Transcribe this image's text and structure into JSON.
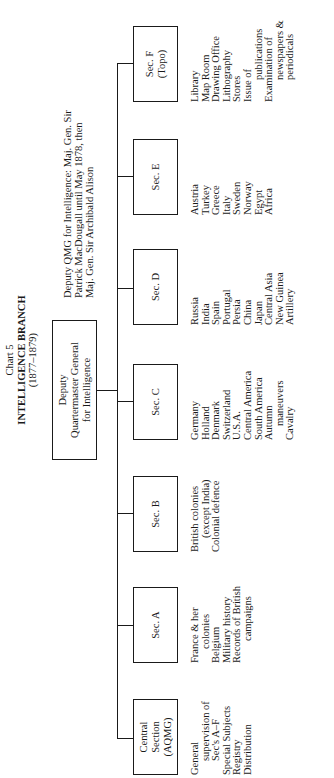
{
  "header": {
    "chart_label": "Chart 5",
    "title": "INTELLIGENCE BRANCH",
    "years": "(1877–1879)"
  },
  "head_box": {
    "lines": [
      "Deputy",
      "Quartermaster General",
      "for Intelligence"
    ]
  },
  "note": {
    "lines": [
      "Deputy QMG for Intelligence:  Maj. Gen. Sir",
      "Patrick MacDougall until May 1878, then",
      "Maj. Gen. Sir Archibald Alison"
    ]
  },
  "sections": [
    {
      "id": "central",
      "label_lines": [
        "Central",
        "Section",
        "(AQMG)"
      ],
      "duties": [
        {
          "text": "General",
          "indent": 0
        },
        {
          "text": "supervision of",
          "indent": 1
        },
        {
          "text": "Sec's A–F",
          "indent": 1
        },
        {
          "text": "Special Subjects",
          "indent": 0
        },
        {
          "text": "Registry",
          "indent": 0
        },
        {
          "text": "Distribution",
          "indent": 0
        }
      ]
    },
    {
      "id": "a",
      "label_lines": [
        "Sec. A"
      ],
      "duties": [
        {
          "text": "France & her",
          "indent": 0
        },
        {
          "text": "colonies",
          "indent": 1
        },
        {
          "text": "Belgium",
          "indent": 0
        },
        {
          "text": "Military history",
          "indent": 0
        },
        {
          "text": "Records of British",
          "indent": 0
        },
        {
          "text": "campaigns",
          "indent": 2
        }
      ]
    },
    {
      "id": "b",
      "label_lines": [
        "Sec. B"
      ],
      "duties": [
        {
          "text": "British colonies",
          "indent": 0
        },
        {
          "text": "(except India)",
          "indent": 1
        },
        {
          "text": "Colonial defence",
          "indent": 0
        }
      ]
    },
    {
      "id": "c",
      "label_lines": [
        "Sec. C"
      ],
      "duties": [
        {
          "text": "Germany",
          "indent": 0
        },
        {
          "text": "Holland",
          "indent": 0
        },
        {
          "text": "Denmark",
          "indent": 0
        },
        {
          "text": "Switzerland",
          "indent": 0
        },
        {
          "text": "U.S.A.",
          "indent": 0
        },
        {
          "text": "Central America",
          "indent": 0
        },
        {
          "text": "South America",
          "indent": 0
        },
        {
          "text": "Autumn",
          "indent": 0
        },
        {
          "text": "maneuvers",
          "indent": 1
        },
        {
          "text": "Cavalry",
          "indent": 0
        }
      ]
    },
    {
      "id": "d",
      "label_lines": [
        "Sec. D"
      ],
      "duties": [
        {
          "text": "Russia",
          "indent": 0
        },
        {
          "text": "India",
          "indent": 0
        },
        {
          "text": "Spain",
          "indent": 0
        },
        {
          "text": "Portugal",
          "indent": 0
        },
        {
          "text": "Persia",
          "indent": 0
        },
        {
          "text": "China",
          "indent": 0
        },
        {
          "text": "Japan",
          "indent": 0
        },
        {
          "text": "Central Asia",
          "indent": 0
        },
        {
          "text": "New Guinea",
          "indent": 0
        },
        {
          "text": "Artillery",
          "indent": 0
        }
      ]
    },
    {
      "id": "e",
      "label_lines": [
        "Sec. E"
      ],
      "duties": [
        {
          "text": "Austria",
          "indent": 0
        },
        {
          "text": "Turkey",
          "indent": 0
        },
        {
          "text": "Greece",
          "indent": 0
        },
        {
          "text": "Italy",
          "indent": 0
        },
        {
          "text": "Sweden",
          "indent": 0
        },
        {
          "text": "Norway",
          "indent": 0
        },
        {
          "text": "Egypt",
          "indent": 0
        },
        {
          "text": "Africa",
          "indent": 0
        }
      ]
    },
    {
      "id": "f",
      "label_lines": [
        "Sec. F",
        "(Topo)"
      ],
      "duties": [
        {
          "text": "Library",
          "indent": 0
        },
        {
          "text": "Map Room",
          "indent": 0
        },
        {
          "text": "Drawing Office",
          "indent": 0
        },
        {
          "text": "Lithography",
          "indent": 0
        },
        {
          "text": "Stores",
          "indent": 0
        },
        {
          "text": "Issue of",
          "indent": 0
        },
        {
          "text": "publications",
          "indent": 2
        },
        {
          "text": "Examination of",
          "indent": 0
        },
        {
          "text": "newspapers &",
          "indent": 2
        },
        {
          "text": "periodicals",
          "indent": 2
        }
      ]
    }
  ]
}
